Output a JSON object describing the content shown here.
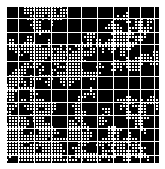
{
  "image": {
    "description": "Black square field overlaid with a white rectilinear grid and meandering white dotted maze-like paths",
    "background_color": "#ffffff",
    "field_color": "#000000",
    "line_color": "#ffffff",
    "field": {
      "x": 6,
      "y": 6,
      "width": 153,
      "height": 157
    },
    "pattern": {
      "cell_size": 3,
      "grid_spacing_major": 12,
      "seed": 1337,
      "path_density": 0.55
    }
  }
}
